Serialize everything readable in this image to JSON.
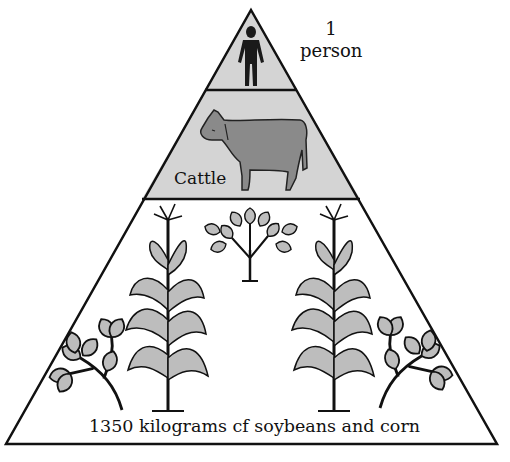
{
  "diagram": {
    "type": "energy-pyramid",
    "levels": [
      {
        "name": "top",
        "label_count": "1",
        "label_unit": "person",
        "icon": "person-icon",
        "fill": "#d4d4d4"
      },
      {
        "name": "middle",
        "label": "Cattle",
        "icon": "cow-icon",
        "fill": "#d4d4d4"
      },
      {
        "name": "bottom",
        "label": "1350 kilograms cf soybeans and corn",
        "icons": [
          "corn-plant-icon",
          "soybean-plant-icon"
        ],
        "fill": "#ffffff"
      }
    ],
    "colors": {
      "outline": "#111111",
      "shaded_layer": "#d4d4d4",
      "icon_fill": "#8a8a8a",
      "leaf_fill": "#bdbdbd"
    }
  }
}
